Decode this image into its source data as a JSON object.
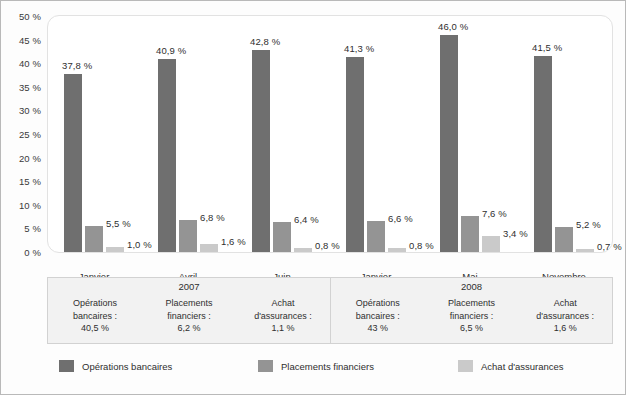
{
  "chart_data": {
    "type": "bar",
    "title": "",
    "xlabel": "",
    "ylabel": "",
    "ylim": [
      0,
      50
    ],
    "grid": false,
    "legend_position": "bottom",
    "categories": [
      "Janvier",
      "Avril",
      "Juin",
      "Janvier",
      "Mai",
      "Novembre"
    ],
    "ytick_labels": [
      "0 %",
      "5 %",
      "10 %",
      "15 %",
      "20 %",
      "25 %",
      "30 %",
      "35 %",
      "40 %",
      "45 %",
      "50 %"
    ],
    "ytick_values": [
      0,
      5,
      10,
      15,
      20,
      25,
      30,
      35,
      40,
      45,
      50
    ],
    "series": [
      {
        "name": "Opérations bancaires",
        "color": "#6f6f6f",
        "values": [
          37.8,
          40.9,
          42.8,
          41.3,
          46.0,
          41.5
        ],
        "data_labels": [
          "37,8 %",
          "40,9 %",
          "42,8 %",
          "41,3 %",
          "46,0 %",
          "41,5 %"
        ]
      },
      {
        "name": "Placements financiers",
        "color": "#949494",
        "values": [
          5.5,
          6.8,
          6.4,
          6.6,
          7.6,
          5.2
        ],
        "data_labels": [
          "5,5 %",
          "6,8 %",
          "6,4 %",
          "6,6 %",
          "7,6 %",
          "5,2 %"
        ]
      },
      {
        "name": "Achat d'assurances",
        "color": "#cacaca",
        "values": [
          1.0,
          1.6,
          0.8,
          0.8,
          3.4,
          0.7
        ],
        "data_labels": [
          "1,0 %",
          "1,6 %",
          "0,8 %",
          "0,8 %",
          "3,4 %",
          "0,7 %"
        ]
      }
    ],
    "annotations": {
      "summary_groups": [
        {
          "year": "2007",
          "columns": [
            {
              "label_line1": "Opérations",
              "label_line2": "bancaires :",
              "value": "40,5 %"
            },
            {
              "label_line1": "Placements",
              "label_line2": "financiers :",
              "value": "6,2 %"
            },
            {
              "label_line1": "Achat",
              "label_line2": "d'assurances :",
              "value": "1,1 %"
            }
          ]
        },
        {
          "year": "2008",
          "columns": [
            {
              "label_line1": "Opérations",
              "label_line2": "bancaires :",
              "value": "43 %"
            },
            {
              "label_line1": "Placements",
              "label_line2": "financiers :",
              "value": "6,5 %"
            },
            {
              "label_line1": "Achat",
              "label_line2": "d'assurances :",
              "value": "1,6 %"
            }
          ]
        }
      ]
    }
  },
  "legend": {
    "items": [
      {
        "label": "Opérations bancaires",
        "color": "#6f6f6f"
      },
      {
        "label": "Placements financiers",
        "color": "#949494"
      },
      {
        "label": "Achat d'assurances",
        "color": "#cacaca"
      }
    ]
  }
}
